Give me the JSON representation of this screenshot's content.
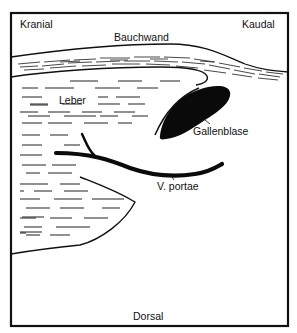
{
  "diagram": {
    "type": "anatomical-schematic",
    "labels": {
      "kranial": "Kranial",
      "kaudal": "Kaudal",
      "bauchwand": "Bauchwand",
      "leber": "Leber",
      "gallenblase": "Gallenblase",
      "v_portae": "V. portae",
      "dorsal": "Dorsal"
    },
    "structures": [
      {
        "id": "bauchwand",
        "label": "Bauchwand",
        "description": "abdominal wall, curved band with dashed muscle texture"
      },
      {
        "id": "leber",
        "label": "Leber",
        "description": "liver, region filled with short horizontal dashes"
      },
      {
        "id": "gallenblase",
        "label": "Gallenblase",
        "description": "gall bladder, solid black oval"
      },
      {
        "id": "v_portae",
        "label": "V. portae",
        "description": "portal vein, thick black curved line"
      }
    ],
    "orientation": {
      "top_left": "Kranial",
      "top_right": "Kaudal",
      "bottom": "Dorsal"
    },
    "colors": {
      "ink": "#111111",
      "background": "#ffffff"
    }
  }
}
